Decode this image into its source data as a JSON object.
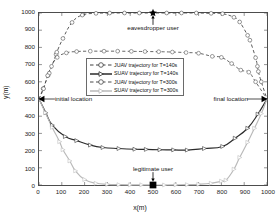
{
  "chart_data": {
    "type": "line",
    "title": "",
    "xlabel": "x(m)",
    "ylabel": "y(m)",
    "xlim": [
      0,
      1000
    ],
    "ylim": [
      0,
      1000
    ],
    "xticks": [
      0,
      100,
      200,
      300,
      400,
      500,
      600,
      700,
      800,
      900,
      1000
    ],
    "yticks": [
      0,
      100,
      200,
      300,
      400,
      500,
      600,
      700,
      800,
      900,
      1000
    ],
    "grid": false,
    "legend_position": "center",
    "series": [
      {
        "name": "JUAV trajectory for T=140s",
        "style": "dashed",
        "marker": "circle",
        "color": "#3f3f3f",
        "points": [
          [
            0,
            500
          ],
          [
            18,
            560
          ],
          [
            40,
            637
          ],
          [
            45,
            650
          ],
          [
            75,
            760
          ],
          [
            78,
            772
          ],
          [
            105,
            852
          ],
          [
            145,
            945
          ],
          [
            190,
            988
          ],
          [
            250,
            998
          ],
          [
            310,
            1000
          ],
          [
            375,
            1000
          ],
          [
            440,
            1000
          ],
          [
            500,
            1000
          ],
          [
            560,
            1000
          ],
          [
            625,
            1000
          ],
          [
            690,
            1000
          ],
          [
            755,
            998
          ],
          [
            805,
            996
          ],
          [
            855,
            975
          ],
          [
            880,
            948
          ],
          [
            915,
            870
          ],
          [
            925,
            842
          ],
          [
            950,
            740
          ],
          [
            958,
            690
          ],
          [
            962,
            660
          ],
          [
            975,
            600
          ],
          [
            1000,
            500
          ]
        ]
      },
      {
        "name": "SUAV trajectory for T=140s",
        "style": "solid",
        "marker": "triangle-right",
        "color": "#2b2b2b",
        "points": [
          [
            0,
            500
          ],
          [
            30,
            420
          ],
          [
            58,
            348
          ],
          [
            115,
            282
          ],
          [
            165,
            258
          ],
          [
            225,
            232
          ],
          [
            280,
            218
          ],
          [
            350,
            212
          ],
          [
            420,
            208
          ],
          [
            470,
            207
          ],
          [
            530,
            205
          ],
          [
            590,
            204
          ],
          [
            650,
            203
          ],
          [
            725,
            212
          ],
          [
            805,
            224
          ],
          [
            860,
            272
          ],
          [
            915,
            330
          ],
          [
            960,
            412
          ],
          [
            1000,
            500
          ]
        ]
      },
      {
        "name": "JUAV trajectory for T=300s",
        "style": "dashed",
        "marker": "circle",
        "color": "#4a4a4a",
        "points": [
          [
            0,
            500
          ],
          [
            20,
            560
          ],
          [
            38,
            636
          ],
          [
            55,
            690
          ],
          [
            80,
            742
          ],
          [
            120,
            768
          ],
          [
            165,
            776
          ],
          [
            225,
            778
          ],
          [
            285,
            778
          ],
          [
            345,
            778
          ],
          [
            405,
            777
          ],
          [
            465,
            776
          ],
          [
            525,
            775
          ],
          [
            585,
            773
          ],
          [
            645,
            770
          ],
          [
            700,
            766
          ],
          [
            760,
            748
          ],
          [
            800,
            742
          ],
          [
            845,
            706
          ],
          [
            885,
            668
          ],
          [
            920,
            656
          ],
          [
            950,
            600
          ],
          [
            1000,
            500
          ]
        ]
      },
      {
        "name": "SUAV trajectory for T=300s",
        "style": "solid",
        "marker": "triangle-right",
        "color": "#b9b9b9",
        "points": [
          [
            0,
            500
          ],
          [
            28,
            420
          ],
          [
            58,
            335
          ],
          [
            90,
            252
          ],
          [
            105,
            205
          ],
          [
            135,
            140
          ],
          [
            160,
            82
          ],
          [
            200,
            32
          ],
          [
            250,
            10
          ],
          [
            300,
            4
          ],
          [
            350,
            2
          ],
          [
            400,
            1
          ],
          [
            450,
            1
          ],
          [
            500,
            0
          ],
          [
            550,
            0
          ],
          [
            600,
            1
          ],
          [
            650,
            2
          ],
          [
            700,
            4
          ],
          [
            755,
            10
          ],
          [
            800,
            22
          ],
          [
            820,
            28
          ],
          [
            855,
            92
          ],
          [
            880,
            160
          ],
          [
            915,
            248
          ],
          [
            945,
            330
          ],
          [
            975,
            415
          ],
          [
            1000,
            500
          ]
        ]
      }
    ],
    "annotations": [
      {
        "name": "eavesdropper-user",
        "label": "eavesdropper user",
        "x": 500,
        "y": 1000,
        "marker": "star"
      },
      {
        "name": "legitimate-user",
        "label": "legitimate user",
        "x": 500,
        "y": 0,
        "marker": "square"
      },
      {
        "name": "initial-location",
        "label": "initial location",
        "x": 0,
        "y": 500,
        "marker": "triangle-left"
      },
      {
        "name": "final-location",
        "label": "final location",
        "x": 1000,
        "y": 500,
        "marker": "triangle-right"
      }
    ]
  },
  "legend": {
    "items": [
      {
        "label": "JUAV trajectory  for T=140s"
      },
      {
        "label": "SUAV trajectory  for T=140s"
      },
      {
        "label": "JUAV trajectory  for T=300s"
      },
      {
        "label": "SUAV trajectory  for T=300s"
      }
    ]
  }
}
